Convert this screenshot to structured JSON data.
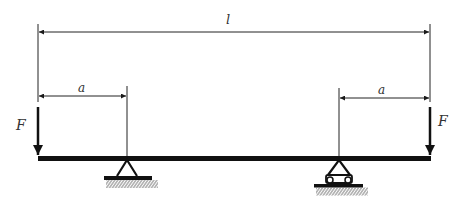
{
  "diagram": {
    "labels": {
      "total_length": "l",
      "left_overhang": "a",
      "right_overhang": "a",
      "left_force": "F",
      "right_force": "F"
    },
    "elements": {
      "beam": "horizontal beam",
      "left_support": "pin support",
      "right_support": "roller support",
      "left_force_direction": "down",
      "right_force_direction": "down"
    },
    "colors": {
      "stroke": "#1a1a1a",
      "beam": "#111111",
      "text": "#333333"
    }
  }
}
